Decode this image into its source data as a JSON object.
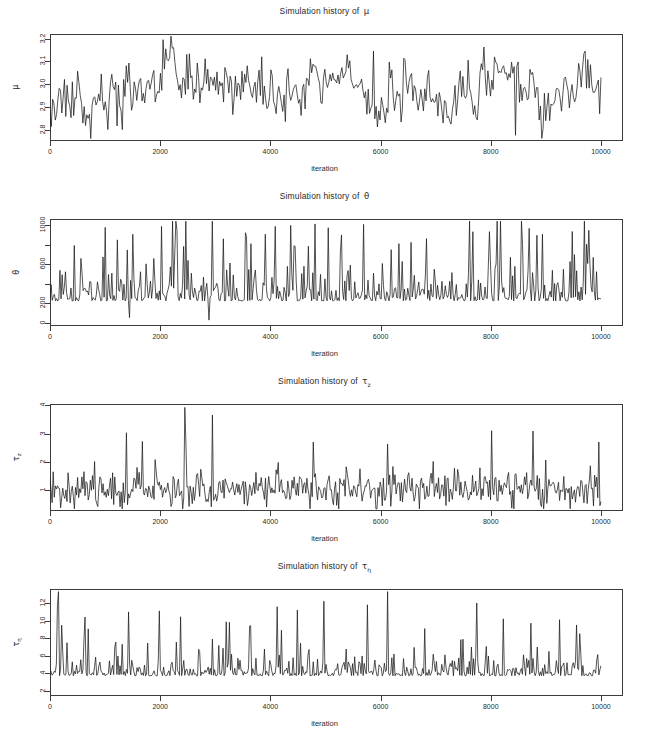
{
  "figure": {
    "background": "#ffffff",
    "ink_color": "#1b1b1b",
    "axis_color": "#3b3b3b",
    "bottom_artifact_text": "",
    "shared_xlabel": "iteration"
  },
  "chart_data": [
    {
      "type": "line",
      "title": "Simulation history of ",
      "title_symbol": "μ",
      "title_symbol_sub": "",
      "ylabel": "μ",
      "ylabel_sub": "",
      "xlabel": "iteration",
      "grid": false,
      "legend": "none",
      "xlim": [
        0,
        10400
      ],
      "ylim": [
        2.75,
        3.22
      ],
      "xticks": [
        0,
        2000,
        4000,
        6000,
        8000,
        10000
      ],
      "xticklabels": [
        "0",
        "2000",
        "4000",
        "6000",
        "8000",
        "10000"
      ],
      "yticks": [
        2.8,
        2.9,
        3.0,
        3.1,
        3.2
      ],
      "yticklabels": [
        "2.8",
        "2.9",
        "3.0",
        "3.1",
        "3.2"
      ],
      "series_name": "mu trace",
      "x_start": 0,
      "x_end": 10000,
      "n_points": 420,
      "baseline": 2.955,
      "noise_sd": 0.048,
      "drift_sd": 0.022,
      "seed": 11,
      "spikes": [
        {
          "x": 2050,
          "y": 3.195
        },
        {
          "x": 2100,
          "y": 3.155
        },
        {
          "x": 2240,
          "y": 3.16
        },
        {
          "x": 3850,
          "y": 3.12
        },
        {
          "x": 5870,
          "y": 3.145
        },
        {
          "x": 7600,
          "y": 3.105
        },
        {
          "x": 9720,
          "y": 3.145
        },
        {
          "x": 8450,
          "y": 2.775
        },
        {
          "x": 1050,
          "y": 2.8
        },
        {
          "x": 1320,
          "y": 2.8
        },
        {
          "x": 4280,
          "y": 2.835
        }
      ]
    },
    {
      "type": "line",
      "title": "Simulation history of ",
      "title_symbol": "θ",
      "title_symbol_sub": "",
      "ylabel": "θ",
      "ylabel_sub": "",
      "xlabel": "iteration",
      "grid": false,
      "legend": "none",
      "xlim": [
        0,
        10400
      ],
      "ylim": [
        -30,
        1060
      ],
      "xticks": [
        0,
        2000,
        4000,
        6000,
        8000,
        10000
      ],
      "xticklabels": [
        "0",
        "2000",
        "4000",
        "6000",
        "8000",
        "10000"
      ],
      "yticks": [
        0,
        200,
        400,
        600,
        800,
        1000
      ],
      "yticklabels": [
        "0",
        "200",
        "",
        "600",
        "",
        "1000"
      ],
      "series_name": "theta trace",
      "x_start": 0,
      "x_end": 10000,
      "n_points": 500,
      "baseline": 320,
      "noise_sd": 150,
      "drift_sd": 0,
      "seed": 23,
      "spikes": [
        {
          "x": 1000,
          "y": 975
        },
        {
          "x": 2020,
          "y": 985
        },
        {
          "x": 2300,
          "y": 945
        },
        {
          "x": 3540,
          "y": 920
        },
        {
          "x": 3560,
          "y": 880
        },
        {
          "x": 3900,
          "y": 905
        },
        {
          "x": 4080,
          "y": 985
        },
        {
          "x": 4800,
          "y": 1010
        },
        {
          "x": 5700,
          "y": 1005
        },
        {
          "x": 6830,
          "y": 860
        },
        {
          "x": 8700,
          "y": 965
        },
        {
          "x": 2880,
          "y": 30
        },
        {
          "x": 1440,
          "y": 55
        }
      ]
    },
    {
      "type": "line",
      "title": "Simulation history of ",
      "title_symbol": "τ",
      "title_symbol_sub": "z",
      "ylabel": "τ",
      "ylabel_sub": "z",
      "xlabel": "iteration",
      "grid": false,
      "legend": "none",
      "xlim": [
        0,
        10400
      ],
      "ylim": [
        0.25,
        4.05
      ],
      "xticks": [
        0,
        2000,
        4000,
        6000,
        8000,
        10000
      ],
      "xticklabels": [
        "0",
        "2000",
        "4000",
        "6000",
        "8000",
        "10000"
      ],
      "yticks": [
        1,
        2,
        3,
        4
      ],
      "yticklabels": [
        "1",
        "2",
        "3",
        "4"
      ],
      "series_name": "tau_z trace",
      "x_start": 0,
      "x_end": 10000,
      "n_points": 520,
      "baseline": 1.05,
      "noise_sd": 0.33,
      "drift_sd": 0,
      "seed": 37,
      "spikes": [
        {
          "x": 2450,
          "y": 3.93
        },
        {
          "x": 2940,
          "y": 3.66
        },
        {
          "x": 1390,
          "y": 3.03
        },
        {
          "x": 8010,
          "y": 3.1
        },
        {
          "x": 8760,
          "y": 3.09
        },
        {
          "x": 2470,
          "y": 2.7
        },
        {
          "x": 4780,
          "y": 2.7
        },
        {
          "x": 6120,
          "y": 2.63
        },
        {
          "x": 9960,
          "y": 2.7
        },
        {
          "x": 1680,
          "y": 2.72
        }
      ]
    },
    {
      "type": "line",
      "title": "Simulation history of ",
      "title_symbol": "τ",
      "title_symbol_sub": "η",
      "ylabel": "τ",
      "ylabel_sub": "η",
      "xlabel": "iteration",
      "grid": false,
      "legend": "none",
      "xlim": [
        0,
        10400
      ],
      "ylim": [
        1.4,
        13.6
      ],
      "xticks": [
        0,
        2000,
        4000,
        6000,
        8000,
        10000
      ],
      "xticklabels": [
        "0",
        "2000",
        "4000",
        "6000",
        "8000",
        "10000"
      ],
      "yticks": [
        2,
        4,
        6,
        8,
        10,
        12
      ],
      "yticklabels": [
        "2",
        "4",
        "6",
        "8",
        "10",
        "12"
      ],
      "series_name": "tau_eta trace",
      "x_start": 0,
      "x_end": 10000,
      "n_points": 520,
      "baseline": 4.3,
      "noise_sd": 0.95,
      "drift_sd": 0,
      "seed": 59,
      "spikes": [
        {
          "x": 150,
          "y": 13.3
        },
        {
          "x": 6120,
          "y": 13.3
        },
        {
          "x": 4980,
          "y": 12.2
        },
        {
          "x": 5760,
          "y": 11.8
        },
        {
          "x": 7750,
          "y": 12.0
        },
        {
          "x": 1980,
          "y": 11.1
        },
        {
          "x": 640,
          "y": 10.4
        },
        {
          "x": 8220,
          "y": 10.2
        },
        {
          "x": 9240,
          "y": 10.1
        },
        {
          "x": 130,
          "y": 11.7
        },
        {
          "x": 3250,
          "y": 9.8
        },
        {
          "x": 9560,
          "y": 9.5
        }
      ]
    }
  ]
}
